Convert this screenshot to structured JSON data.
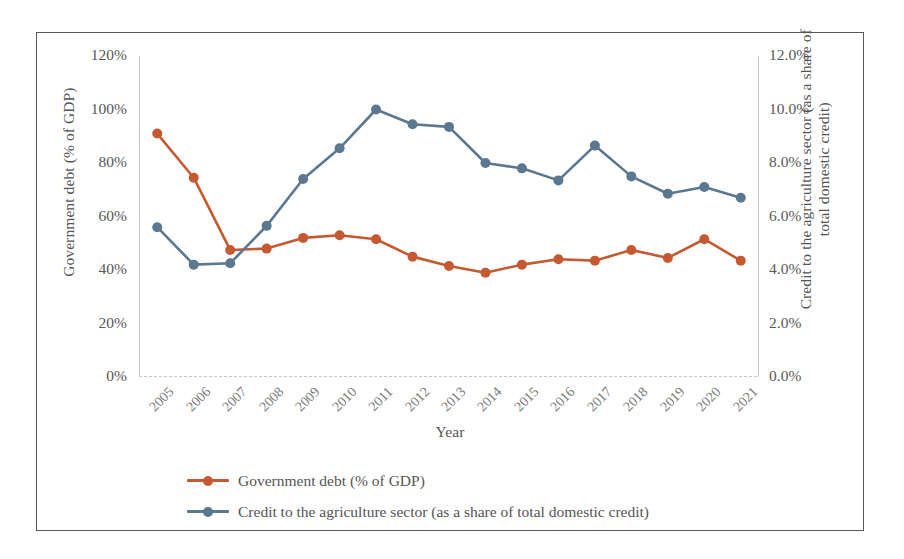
{
  "chart_data": {
    "type": "line",
    "title": "",
    "xlabel": "Year",
    "ylabel": "Government debt (% of GDP)",
    "ylabel_secondary": "Credit to the agriculture sector (as a share of total domestic credit)",
    "grid": false,
    "legend_position": "bottom-left",
    "categories": [
      "2005",
      "2006",
      "2007",
      "2008",
      "2009",
      "2010",
      "2011",
      "2012",
      "2013",
      "2014",
      "2015",
      "2016",
      "2017",
      "2018",
      "2019",
      "2020",
      "2021"
    ],
    "axes": {
      "left": {
        "label": "Government debt (% of GDP)",
        "ticks": [
          "0%",
          "20%",
          "40%",
          "60%",
          "80%",
          "100%",
          "120%"
        ],
        "tick_values": [
          0,
          20,
          40,
          60,
          80,
          100,
          120
        ],
        "min": 0,
        "max": 120
      },
      "right": {
        "label": "Credit to the agriculture sector (as a share of total domestic credit)",
        "ticks": [
          "0.0%",
          "2.0%",
          "4.0%",
          "6.0%",
          "8.0%",
          "10.0%",
          "12.0%"
        ],
        "tick_values": [
          0,
          2,
          4,
          6,
          8,
          10,
          12
        ],
        "min": 0,
        "max": 12
      }
    },
    "series": [
      {
        "name": "Government debt (% of GDP)",
        "axis": "left",
        "color": "#C55A32",
        "marker": "circle",
        "values": [
          91.0,
          74.5,
          47.5,
          48.0,
          52.0,
          53.0,
          51.5,
          45.0,
          41.5,
          39.0,
          42.0,
          44.0,
          43.5,
          47.5,
          44.5,
          51.5,
          43.5
        ]
      },
      {
        "name": "Credit to the agriculture sector (as a share of total domestic credit)",
        "axis": "right",
        "color": "#5B7890",
        "marker": "circle",
        "values": [
          5.6,
          4.2,
          4.25,
          5.65,
          7.4,
          8.55,
          10.0,
          9.45,
          9.35,
          8.0,
          7.8,
          7.35,
          8.65,
          7.5,
          6.85,
          7.1,
          6.7
        ]
      }
    ]
  },
  "legend": {
    "items": [
      {
        "label": "Government debt (% of GDP)",
        "color": "#C55A32"
      },
      {
        "label": "Credit to the agriculture sector (as a share of total domestic credit)",
        "color": "#5B7890"
      }
    ]
  }
}
